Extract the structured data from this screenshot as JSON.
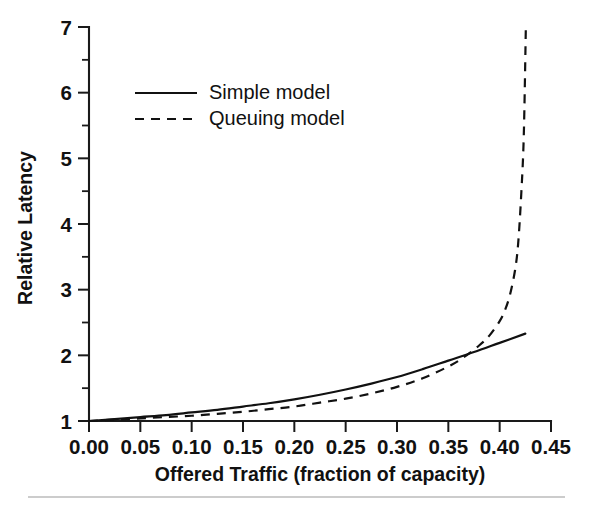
{
  "chart_data": {
    "type": "line",
    "title": "",
    "xlabel": "Offered Traffic (fraction of capacity)",
    "ylabel": "Relative Latency",
    "xlim": [
      0.0,
      0.45
    ],
    "ylim": [
      1,
      7
    ],
    "grid": false,
    "legend_position": "upper-left-inside",
    "x_ticks": [
      "0.00",
      "0.05",
      "0.10",
      "0.15",
      "0.20",
      "0.25",
      "0.30",
      "0.35",
      "0.40",
      "0.45"
    ],
    "x_tick_values": [
      0.0,
      0.05,
      0.1,
      0.15,
      0.2,
      0.25,
      0.3,
      0.35,
      0.4,
      0.45
    ],
    "y_ticks": [
      "1",
      "2",
      "3",
      "4",
      "5",
      "6",
      "7"
    ],
    "y_tick_values": [
      1,
      2,
      3,
      4,
      5,
      6,
      7
    ],
    "y_minor_tick_values": [
      1.5,
      2.5,
      3.5,
      4.5,
      5.5,
      6.5
    ],
    "series": [
      {
        "name": "Simple model",
        "style": "solid",
        "color": "#111111",
        "x": [
          0.0,
          0.025,
          0.05,
          0.075,
          0.1,
          0.125,
          0.15,
          0.175,
          0.2,
          0.225,
          0.25,
          0.275,
          0.3,
          0.325,
          0.35,
          0.375,
          0.4,
          0.425
        ],
        "y": [
          1.0,
          1.03,
          1.06,
          1.09,
          1.13,
          1.17,
          1.22,
          1.27,
          1.33,
          1.4,
          1.48,
          1.57,
          1.67,
          1.79,
          1.92,
          2.05,
          2.19,
          2.33
        ]
      },
      {
        "name": "Queuing model",
        "style": "dashed",
        "color": "#111111",
        "x": [
          0.0,
          0.025,
          0.05,
          0.075,
          0.1,
          0.125,
          0.15,
          0.175,
          0.2,
          0.225,
          0.25,
          0.275,
          0.3,
          0.325,
          0.35,
          0.365,
          0.38,
          0.39,
          0.4,
          0.405,
          0.41,
          0.415,
          0.418,
          0.421,
          0.4235,
          0.4255
        ],
        "y": [
          1.0,
          1.02,
          1.04,
          1.06,
          1.08,
          1.11,
          1.14,
          1.18,
          1.22,
          1.28,
          1.34,
          1.42,
          1.52,
          1.65,
          1.83,
          1.97,
          2.15,
          2.3,
          2.52,
          2.68,
          2.92,
          3.3,
          3.7,
          4.45,
          5.35,
          7.0
        ]
      }
    ]
  },
  "legend": {
    "entries": [
      {
        "label": "Simple model",
        "style": "solid"
      },
      {
        "label": "Queuing model",
        "style": "dashed"
      }
    ]
  },
  "axes": {
    "x_title": "Offered Traffic (fraction of capacity)",
    "y_title": "Relative Latency"
  }
}
